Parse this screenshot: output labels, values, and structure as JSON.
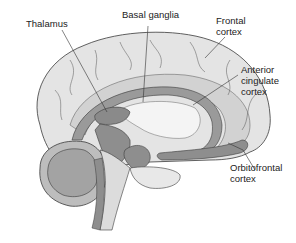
{
  "diagram": {
    "type": "brain-midsagittal-section",
    "labels": [
      {
        "id": "thalamus",
        "lines": [
          "Thalamus"
        ]
      },
      {
        "id": "basal-ganglia",
        "lines": [
          "Basal ganglia"
        ]
      },
      {
        "id": "frontal-cortex",
        "lines": [
          "Frontal",
          "cortex"
        ]
      },
      {
        "id": "anterior-cingulate-cortex",
        "lines": [
          "Anterior",
          "cingulate",
          "cortex"
        ]
      },
      {
        "id": "orbitofrontal-cortex",
        "lines": [
          "Orbitofrontal",
          "cortex"
        ]
      }
    ],
    "colors": {
      "cortex_light": "#e6e6e6",
      "cortex_mid": "#cfcfcf",
      "highlight_dark": "#8e8e8e",
      "outline": "#3a3a3a",
      "background": "#ffffff"
    }
  }
}
